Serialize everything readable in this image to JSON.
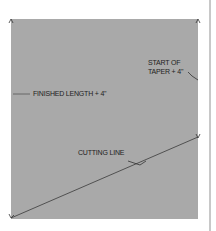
{
  "diagram": {
    "labels": {
      "finished_length": "FINISHED LENGTH + 4\"",
      "start_of_taper_line1": "START OF",
      "start_of_taper_line2": "TAPER + 4\"",
      "cutting_line": "CUTTING LINE"
    },
    "colors": {
      "fabric": "#a9a9a9",
      "line": "#3a3a3a",
      "background": "#ffffff"
    }
  }
}
